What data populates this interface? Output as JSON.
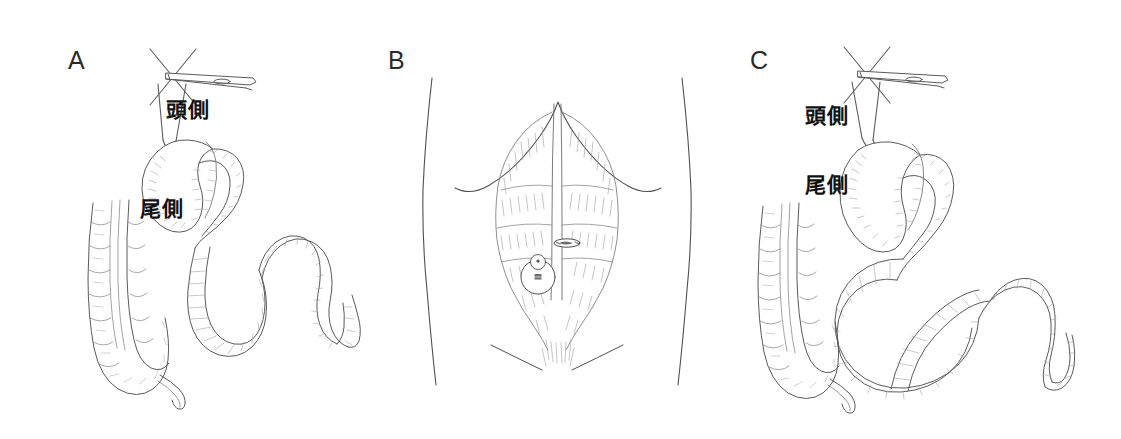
{
  "figure": {
    "background_color": "#ffffff",
    "ink_color": "#555555",
    "hatch_color": "#9a9a9a",
    "label_color": "#111111",
    "panel_letter_color": "#2b2b2b",
    "width": 1121,
    "height": 439
  },
  "panels": [
    {
      "letter": "A",
      "name": "panel-a",
      "subject": "bowel-loop-held-by-forceps",
      "labels": [
        {
          "text": "頭側",
          "meaning": "cranial-side"
        },
        {
          "text": "尾側",
          "meaning": "caudal-side"
        }
      ],
      "elements": [
        "surgical-forceps",
        "suture-threads",
        "small-bowel-loop",
        "colon-segment",
        "appendix"
      ]
    },
    {
      "letter": "B",
      "name": "panel-b",
      "subject": "abdominal-wall-stoma-site",
      "labels": [],
      "elements": [
        "torso-outline",
        "costal-margin",
        "rectus-abdominis",
        "linea-alba",
        "tendinous-intersections",
        "umbilicus",
        "stoma-site-marking",
        "inguinal-ligament"
      ]
    },
    {
      "letter": "C",
      "name": "panel-c",
      "subject": "bowel-loop-rotated-held-by-forceps",
      "labels": [
        {
          "text": "頭側",
          "meaning": "cranial-side"
        },
        {
          "text": "尾側",
          "meaning": "caudal-side"
        }
      ],
      "elements": [
        "surgical-forceps",
        "suture-threads",
        "small-bowel-loop",
        "twisted-bowel-loop",
        "colon-segment",
        "appendix"
      ]
    }
  ]
}
